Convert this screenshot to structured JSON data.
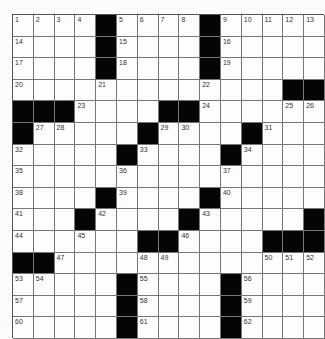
{
  "puzzle": {
    "rows": 15,
    "cols": 15,
    "colors": {
      "background": "#fbfbfb",
      "cell": "#fdfdfd",
      "block": "#050505",
      "gridline": "#777777",
      "number": "#333333"
    },
    "grid": [
      [
        "1",
        "2",
        "3",
        "4",
        "#",
        "5",
        "6",
        "7",
        "8",
        "#",
        "9",
        "10",
        "11",
        "12",
        "13"
      ],
      [
        "14",
        "",
        "",
        "",
        "#",
        "15",
        "",
        "",
        "",
        "#",
        "16",
        "",
        "",
        "",
        ""
      ],
      [
        "17",
        "",
        "",
        "",
        "#",
        "18",
        "",
        "",
        "",
        "#",
        "19",
        "",
        "",
        "",
        ""
      ],
      [
        "20",
        "",
        "",
        "",
        "21",
        "",
        "",
        "",
        "",
        "22",
        "",
        "",
        "",
        "#",
        "#"
      ],
      [
        "#",
        "#",
        "#",
        "23",
        "",
        "",
        "",
        "#",
        "#",
        "24",
        "",
        "",
        "",
        "25",
        "26"
      ],
      [
        "#",
        "27",
        "28",
        "",
        "",
        "",
        "#",
        "29",
        "30",
        "",
        "",
        "#",
        "31",
        "",
        ""
      ],
      [
        "32",
        "",
        "",
        "",
        "",
        "#",
        "33",
        "",
        "",
        "",
        "#",
        "34",
        "",
        "",
        ""
      ],
      [
        "35",
        "",
        "",
        "",
        "",
        "36",
        "",
        "",
        "",
        "",
        "37",
        "",
        "",
        "",
        ""
      ],
      [
        "38",
        "",
        "",
        "",
        "#",
        "39",
        "",
        "",
        "",
        "#",
        "40",
        "",
        "",
        "",
        ""
      ],
      [
        "41",
        "",
        "",
        "#",
        "42",
        "",
        "",
        "",
        "#",
        "43",
        "",
        "",
        "",
        "",
        "#"
      ],
      [
        "44",
        "",
        "",
        "45",
        "",
        "",
        "#",
        "#",
        "46",
        "",
        "",
        "",
        "#",
        "#",
        "#"
      ],
      [
        "#",
        "#",
        "47",
        "",
        "",
        "",
        "48",
        "49",
        "",
        "",
        "",
        "",
        "50",
        "51",
        "52"
      ],
      [
        "53",
        "54",
        "",
        "",
        "",
        "#",
        "55",
        "",
        "",
        "",
        "#",
        "56",
        "",
        "",
        ""
      ],
      [
        "57",
        "",
        "",
        "",
        "",
        "#",
        "58",
        "",
        "",
        "",
        "#",
        "59",
        "",
        "",
        ""
      ],
      [
        "60",
        "",
        "",
        "",
        "",
        "#",
        "61",
        "",
        "",
        "",
        "#",
        "62",
        "",
        "",
        ""
      ]
    ]
  }
}
